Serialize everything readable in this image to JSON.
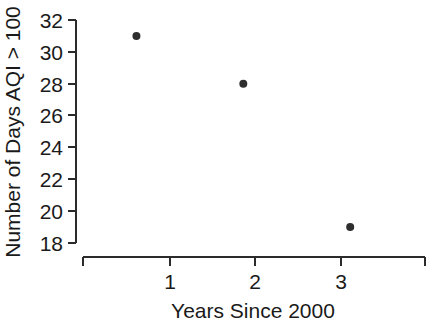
{
  "chart_data": {
    "type": "scatter",
    "title": "",
    "xlabel": "Years Since 2000",
    "ylabel": "Number of Days AQI > 100",
    "x": [
      1,
      2,
      3
    ],
    "values": [
      31,
      28,
      19
    ],
    "points": [
      {
        "x": 1,
        "y": 31
      },
      {
        "x": 2,
        "y": 28
      },
      {
        "x": 3,
        "y": 19
      }
    ],
    "xtick_labels": [
      "1",
      "2",
      "3"
    ],
    "ytick_labels": [
      "32",
      "30",
      "28",
      "26",
      "24",
      "22",
      "20",
      "18"
    ],
    "ytick_values": [
      32,
      30,
      28,
      26,
      24,
      22,
      20,
      18
    ],
    "xlim": [
      0.5,
      3.7
    ],
    "ylim": [
      18,
      32
    ],
    "grid": false,
    "legend": false,
    "marker": "filled-circle",
    "marker_color": "#2e2e2e",
    "axis_color": "#2b2b2b",
    "background_color": "#ffffff"
  }
}
